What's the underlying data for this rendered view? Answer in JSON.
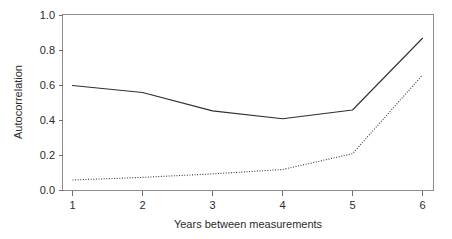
{
  "chart_data": {
    "type": "line",
    "title": "",
    "xlabel": "Years between measurements",
    "ylabel": "Autocorrelation",
    "x": [
      1,
      2,
      3,
      4,
      5,
      6
    ],
    "xticklabels": [
      "1",
      "2",
      "3",
      "4",
      "5",
      "6"
    ],
    "yticklabels": [
      "0.0",
      "0.2",
      "0.4",
      "0.6",
      "0.8",
      "1.0"
    ],
    "yticks": [
      0.0,
      0.2,
      0.4,
      0.6,
      0.8,
      1.0
    ],
    "xlim": [
      0.65,
      6.2
    ],
    "ylim": [
      -0.04,
      1.04
    ],
    "grid": false,
    "legend": "none",
    "series": [
      {
        "name": "solid-series",
        "style": "solid",
        "color": "#2f2f2f",
        "values": [
          0.6,
          0.56,
          0.455,
          0.41,
          0.46,
          0.87
        ]
      },
      {
        "name": "dotted-series",
        "style": "dotted",
        "color": "#3a3a3a",
        "values": [
          0.06,
          0.075,
          0.095,
          0.12,
          0.21,
          0.66
        ]
      }
    ]
  },
  "axes": {
    "y_title": "Autocorrelation",
    "x_title": "Years between measurements"
  }
}
